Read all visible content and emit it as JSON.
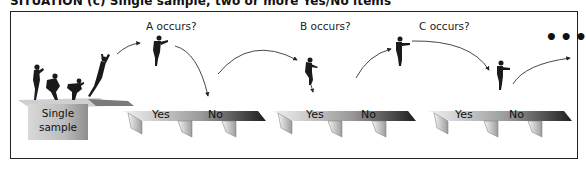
{
  "title": "SITUATION (c)  Single sample, two or more Yes/No items",
  "start": {
    "label_line1": "Single",
    "label_line2": "sample"
  },
  "questions": [
    {
      "label": "A occurs?",
      "yes": "Yes",
      "no": "No"
    },
    {
      "label": "B occurs?",
      "yes": "Yes",
      "no": "No"
    },
    {
      "label": "C occurs?",
      "yes": "Yes",
      "no": "No"
    }
  ],
  "continuation": "•••",
  "colors": {
    "frame": "#222222",
    "platform_dark": "#2a2a2a",
    "platform_light": "#e8e8e8",
    "figure": "#1a1a1a"
  }
}
